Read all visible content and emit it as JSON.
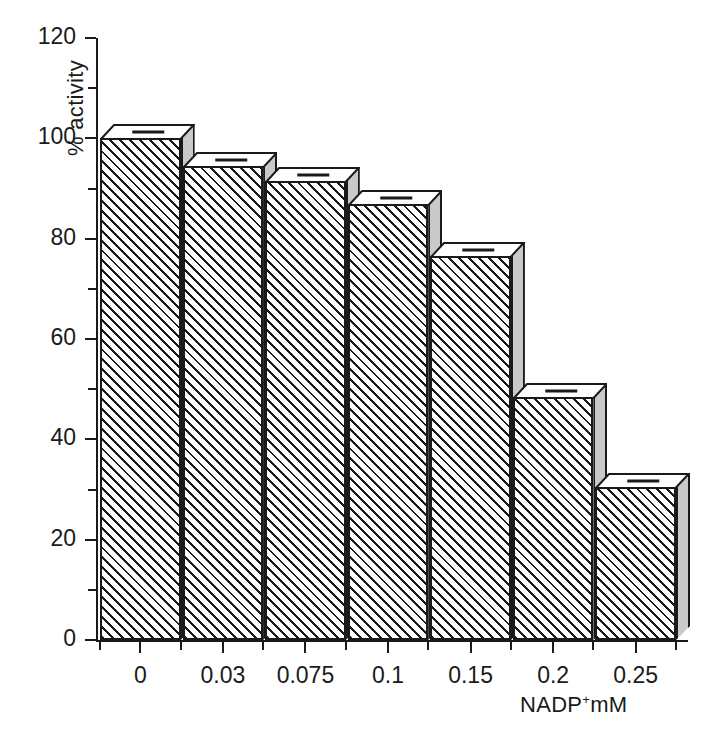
{
  "chart_data": {
    "type": "bar",
    "title": "",
    "subtitle": "",
    "xlabel": "NADP+mM",
    "xlabel_base": "NADP",
    "xlabel_sup": "+",
    "xlabel_tail": "mM",
    "ylabel": "% activity",
    "categories": [
      "0",
      "0.03",
      "0.075",
      "0.1",
      "0.15",
      "0.2",
      "0.25"
    ],
    "values": [
      100,
      94.5,
      91.5,
      87,
      76.5,
      48.5,
      30.5
    ],
    "series": [
      {
        "name": "% activity",
        "values": [
          100,
          94.5,
          91.5,
          87,
          76.5,
          48.5,
          30.5
        ]
      }
    ],
    "ylim": [
      0,
      120
    ],
    "xlim_note": "categorical, 7 equal-width adjacent bars",
    "y_major_ticks": [
      0,
      20,
      40,
      60,
      80,
      100,
      120
    ],
    "y_minor_ticks": [
      10,
      30,
      50,
      70,
      90,
      110
    ],
    "y_tick_labels": [
      "0",
      "20",
      "40",
      "60",
      "80",
      "100",
      "120"
    ],
    "grid": false,
    "legend": null,
    "legend_position": "none",
    "annotations": [
      "Each bar is drawn as a 3-D block: hatched front face, light grey right face, white top face with a short horizontal marker line."
    ],
    "style": {
      "bar_face": "diagonal-hatch",
      "bar_side_color": "#c9c9c9",
      "bar_top_color": "#ffffff",
      "line_color": "#1a1a1a",
      "background": "#ffffff"
    }
  },
  "axes": {
    "y_axis_name": "y-axis",
    "x_axis_name": "x-axis"
  }
}
